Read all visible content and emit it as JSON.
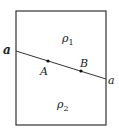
{
  "diagram": {
    "type": "interface-between-two-media",
    "colors": {
      "stroke": "#333333",
      "text": "#222222",
      "background": "#ffffff"
    },
    "boundary_line": {
      "label_left": "a",
      "label_right": "a"
    },
    "points": [
      {
        "id": "A",
        "label": "A"
      },
      {
        "id": "B",
        "label": "B"
      }
    ],
    "regions": [
      {
        "id": "upper",
        "symbol": "ρ",
        "subscript": "1"
      },
      {
        "id": "lower",
        "symbol": "ρ",
        "subscript": "2"
      }
    ]
  }
}
